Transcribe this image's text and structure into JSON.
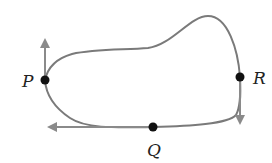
{
  "diagram": {
    "type": "closed-curve-with-velocity-vectors",
    "colors": {
      "curve": "#7a7a7a",
      "arrow": "#8a8a8a",
      "point": "#111111",
      "label": "#222222"
    },
    "points": [
      {
        "id": "P",
        "label": "P",
        "x": 45,
        "y": 80,
        "label_x": 22,
        "label_y": 87
      },
      {
        "id": "Q",
        "label": "Q",
        "x": 153,
        "y": 127,
        "label_x": 147,
        "label_y": 156
      },
      {
        "id": "R",
        "label": "R",
        "x": 240,
        "y": 77,
        "label_x": 253,
        "label_y": 84
      }
    ],
    "vectors": [
      {
        "at": "P",
        "direction": "up",
        "x1": 45,
        "y1": 80,
        "x2": 45,
        "y2": 38
      },
      {
        "at": "R",
        "direction": "down",
        "x1": 240,
        "y1": 77,
        "x2": 240,
        "y2": 125
      },
      {
        "at": "Q",
        "direction": "left",
        "x1": 153,
        "y1": 127,
        "x2": 47,
        "y2": 127
      }
    ]
  }
}
